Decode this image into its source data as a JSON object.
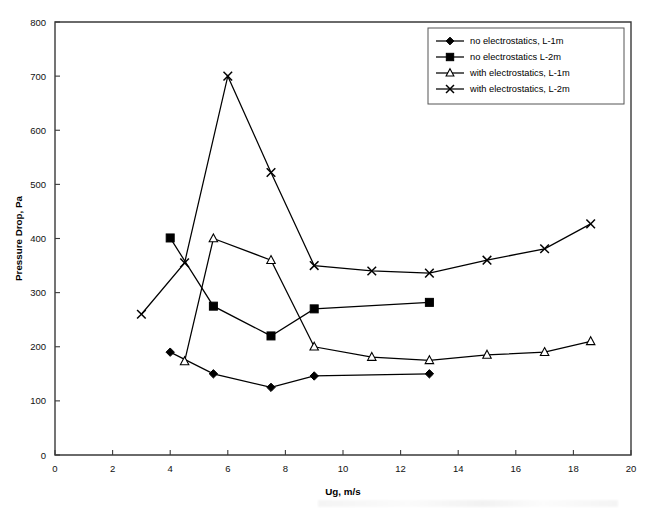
{
  "chart_data": {
    "type": "line",
    "title": "",
    "xlabel": "Ug, m/s",
    "ylabel": "Pressure Drop, Pa",
    "xlim": [
      0,
      20
    ],
    "ylim": [
      0,
      800
    ],
    "xticks": [
      0,
      2,
      4,
      6,
      8,
      10,
      12,
      14,
      16,
      18,
      20
    ],
    "yticks": [
      0,
      100,
      200,
      300,
      400,
      500,
      600,
      700,
      800
    ],
    "grid": false,
    "legend_position": "top-right",
    "series": [
      {
        "name": "no electrostatics, L-1m",
        "marker": "filled-diamond",
        "x": [
          4,
          5.5,
          7.5,
          9,
          13
        ],
        "y": [
          190,
          150,
          125,
          146,
          150
        ]
      },
      {
        "name": "no electrostatics L-2m",
        "marker": "filled-square",
        "x": [
          4,
          5.5,
          7.5,
          9,
          13
        ],
        "y": [
          401,
          275,
          220,
          270,
          282
        ]
      },
      {
        "name": "with electrostatics,  L-1m",
        "marker": "open-triangle",
        "x": [
          4.5,
          5.5,
          7.5,
          9,
          11,
          13,
          15,
          17,
          18.6
        ],
        "y": [
          173,
          400,
          360,
          200,
          181,
          175,
          185,
          190,
          210
        ]
      },
      {
        "name": "with electrostatics, L-2m",
        "marker": "cross",
        "x": [
          3,
          4.5,
          6,
          7.5,
          9,
          11,
          13,
          15,
          17,
          18.6
        ],
        "y": [
          260,
          355,
          700,
          522,
          350,
          340,
          336,
          360,
          381,
          427
        ]
      }
    ]
  },
  "legend": {
    "items": [
      {
        "label": "no electrostatics, L-1m",
        "marker": "filled-diamond"
      },
      {
        "label": "no electrostatics L-2m",
        "marker": "filled-square"
      },
      {
        "label": "with electrostatics,  L-1m",
        "marker": "open-triangle"
      },
      {
        "label": "with electrostatics, L-2m",
        "marker": "cross"
      }
    ]
  }
}
